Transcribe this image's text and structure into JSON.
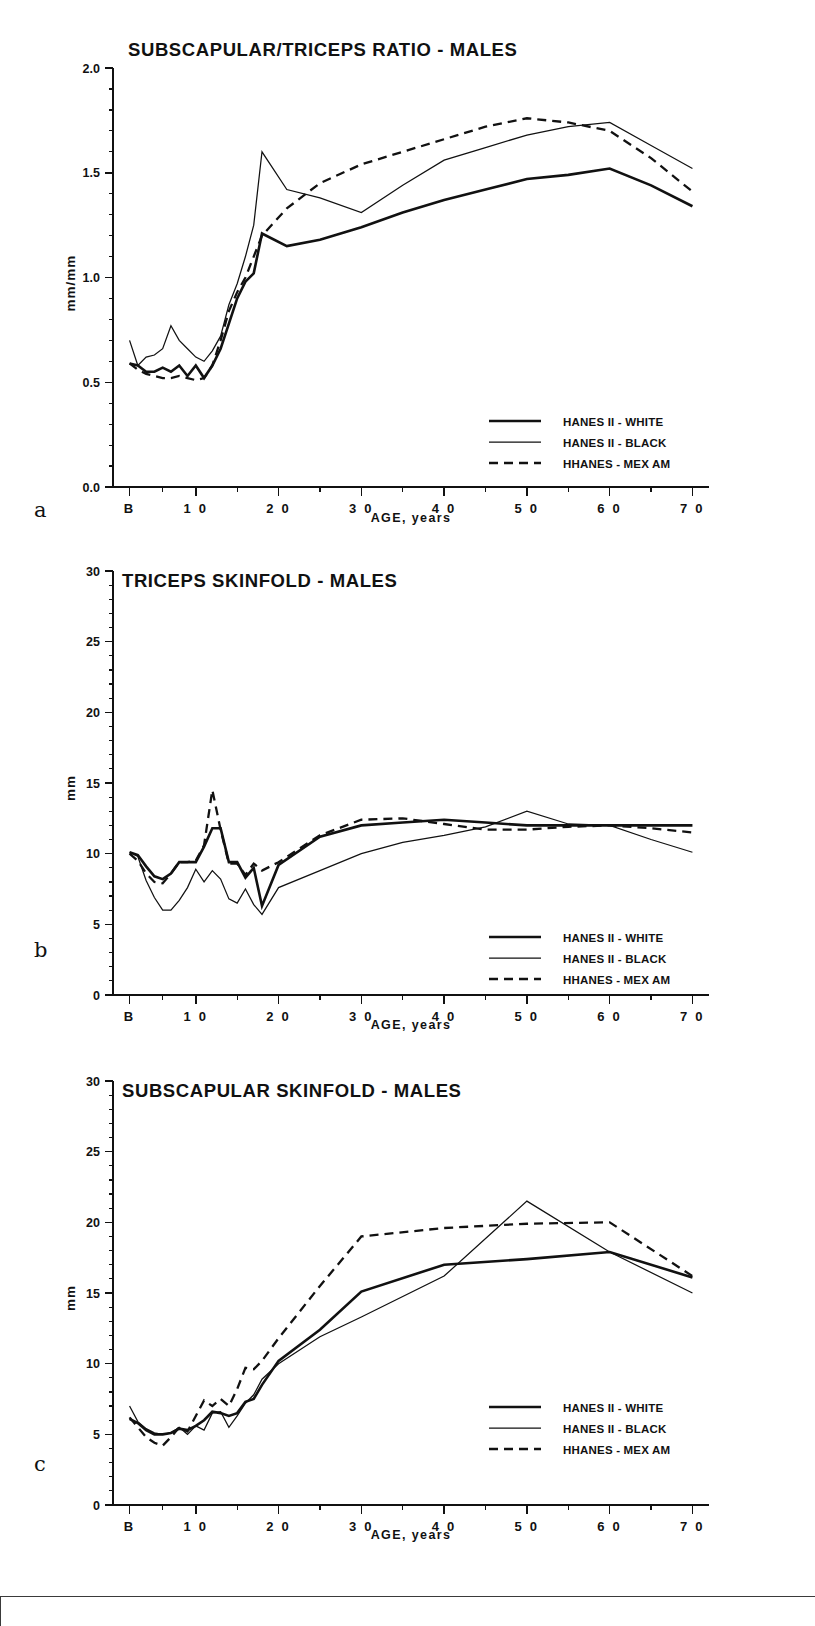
{
  "figure": {
    "panel_letters": [
      "a",
      "b",
      "c"
    ],
    "legend_entries": [
      {
        "label": "HANES II - WHITE",
        "style": "solid-thick"
      },
      {
        "label": "HANES II - BLACK",
        "style": "solid-thin"
      },
      {
        "label": "HHANES - MEX AM",
        "style": "dashed"
      }
    ]
  },
  "chart_data": [
    {
      "type": "line",
      "panel": "a",
      "title": "SUBSCAPULAR/TRICEPS RATIO - MALES",
      "xlabel": "AGE,  years",
      "ylabel": "mm/mm",
      "xlim": [
        0,
        72
      ],
      "ylim": [
        0.0,
        2.0
      ],
      "yticks": [
        0.0,
        0.5,
        1.0,
        1.5,
        2.0
      ],
      "yticklabels": [
        "0.0",
        "0.5",
        "1.0",
        "1.5",
        "2.0"
      ],
      "yminor_step": 0.1,
      "xticks": [
        2,
        10,
        20,
        30,
        40,
        50,
        60,
        70
      ],
      "xticklabels": [
        "B",
        "1 0",
        "2 0",
        "3 0",
        "4 0",
        "5 0",
        "6 0",
        "7 0"
      ],
      "xminor": [
        6,
        15,
        25,
        35,
        45,
        55,
        65
      ],
      "grid": false,
      "legend_position": "lower-right",
      "series": [
        {
          "name": "HANES II - WHITE",
          "x": [
            2,
            3,
            4,
            5,
            6,
            7,
            8,
            9,
            10,
            11,
            12,
            13,
            14,
            15,
            16,
            17,
            18,
            21,
            25,
            30,
            35,
            40,
            45,
            50,
            55,
            60,
            65,
            70
          ],
          "values": [
            0.59,
            0.58,
            0.55,
            0.55,
            0.57,
            0.55,
            0.58,
            0.53,
            0.58,
            0.52,
            0.58,
            0.66,
            0.78,
            0.9,
            0.98,
            1.02,
            1.21,
            1.15,
            1.18,
            1.24,
            1.31,
            1.37,
            1.42,
            1.47,
            1.49,
            1.52,
            1.44,
            1.34
          ]
        },
        {
          "name": "HANES II - BLACK",
          "x": [
            2,
            3,
            4,
            5,
            6,
            7,
            8,
            9,
            10,
            11,
            12,
            13,
            14,
            15,
            16,
            17,
            18,
            21,
            25,
            30,
            35,
            40,
            45,
            50,
            55,
            60,
            65,
            70
          ],
          "values": [
            0.7,
            0.58,
            0.62,
            0.63,
            0.66,
            0.77,
            0.7,
            0.66,
            0.62,
            0.6,
            0.65,
            0.72,
            0.87,
            0.97,
            1.1,
            1.25,
            1.6,
            1.42,
            1.38,
            1.31,
            1.44,
            1.56,
            1.62,
            1.68,
            1.72,
            1.74,
            1.63,
            1.52
          ]
        },
        {
          "name": "HHANES - MEX AM",
          "x": [
            2,
            3,
            4,
            5,
            6,
            7,
            8,
            9,
            10,
            11,
            12,
            13,
            14,
            15,
            16,
            17,
            18,
            21,
            25,
            30,
            35,
            40,
            45,
            50,
            55,
            60,
            65,
            70
          ],
          "values": [
            0.59,
            0.56,
            0.54,
            0.53,
            0.52,
            0.52,
            0.53,
            0.52,
            0.51,
            0.52,
            0.58,
            0.7,
            0.84,
            0.93,
            1.0,
            1.1,
            1.2,
            1.33,
            1.45,
            1.54,
            1.6,
            1.66,
            1.72,
            1.76,
            1.74,
            1.7,
            1.57,
            1.41
          ]
        }
      ]
    },
    {
      "type": "line",
      "panel": "b",
      "title": "TRICEPS SKINFOLD - MALES",
      "xlabel": "AGE,  years",
      "ylabel": "mm",
      "xlim": [
        0,
        72
      ],
      "ylim": [
        0,
        30
      ],
      "yticks": [
        0,
        5,
        10,
        15,
        20,
        25,
        30
      ],
      "yticklabels": [
        "0",
        "5",
        "10",
        "15",
        "20",
        "25",
        "30"
      ],
      "yminor_step": 1,
      "xticks": [
        2,
        10,
        20,
        30,
        40,
        50,
        60,
        70
      ],
      "xticklabels": [
        "B",
        "1 0",
        "2 0",
        "3 0",
        "4 0",
        "5 0",
        "6 0",
        "7 0"
      ],
      "xminor": [
        6,
        15,
        25,
        35,
        45,
        55,
        65
      ],
      "grid": false,
      "legend_position": "lower-right",
      "series": [
        {
          "name": "HANES II - WHITE",
          "x": [
            2,
            3,
            4,
            5,
            6,
            7,
            8,
            9,
            10,
            11,
            12,
            13,
            14,
            15,
            16,
            17,
            18,
            20,
            25,
            30,
            35,
            40,
            45,
            50,
            55,
            60,
            65,
            70
          ],
          "values": [
            10.1,
            9.9,
            9.1,
            8.4,
            8.2,
            8.6,
            9.4,
            9.4,
            9.4,
            10.5,
            11.8,
            11.8,
            9.4,
            9.4,
            8.3,
            9.0,
            6.3,
            9.2,
            11.2,
            12.0,
            12.2,
            12.4,
            12.2,
            12.0,
            12.0,
            12.0,
            12.0,
            12.0
          ]
        },
        {
          "name": "HANES II - BLACK",
          "x": [
            2,
            3,
            4,
            5,
            6,
            7,
            8,
            9,
            10,
            11,
            12,
            13,
            14,
            15,
            16,
            17,
            18,
            20,
            25,
            30,
            35,
            40,
            45,
            50,
            55,
            60,
            65,
            70
          ],
          "values": [
            10.1,
            9.8,
            8.1,
            6.9,
            6.0,
            6.0,
            6.7,
            7.6,
            8.9,
            8.0,
            8.8,
            8.2,
            6.8,
            6.5,
            7.5,
            6.4,
            5.7,
            7.6,
            8.8,
            10.0,
            10.8,
            11.3,
            11.9,
            13.0,
            12.1,
            12.0,
            11.0,
            10.1
          ]
        },
        {
          "name": "HHANES - MEX AM",
          "x": [
            2,
            3,
            4,
            5,
            6,
            7,
            8,
            9,
            10,
            11,
            12,
            13,
            14,
            15,
            16,
            17,
            18,
            20,
            25,
            30,
            35,
            40,
            45,
            50,
            55,
            60,
            65,
            70
          ],
          "values": [
            10.0,
            9.5,
            8.6,
            8.0,
            7.9,
            8.6,
            9.4,
            9.4,
            9.5,
            10.6,
            14.5,
            11.7,
            9.3,
            9.3,
            8.5,
            9.3,
            8.8,
            9.4,
            11.3,
            12.4,
            12.5,
            12.1,
            11.7,
            11.7,
            11.9,
            12.0,
            11.8,
            11.5
          ]
        }
      ]
    },
    {
      "type": "line",
      "panel": "c",
      "title": "SUBSCAPULAR SKINFOLD - MALES",
      "xlabel": "AGE,  years",
      "ylabel": "mm",
      "xlim": [
        0,
        72
      ],
      "ylim": [
        0,
        30
      ],
      "yticks": [
        0,
        5,
        10,
        15,
        20,
        25,
        30
      ],
      "yticklabels": [
        "0",
        "5",
        "10",
        "15",
        "20",
        "25",
        "30"
      ],
      "yminor_step": 1,
      "xticks": [
        2,
        10,
        20,
        30,
        40,
        50,
        60,
        70
      ],
      "xticklabels": [
        "B",
        "1 0",
        "2 0",
        "3 0",
        "4 0",
        "5 0",
        "6 0",
        "7 0"
      ],
      "xminor": [
        6,
        15,
        25,
        35,
        45,
        55,
        65
      ],
      "grid": false,
      "legend_position": "lower-right",
      "series": [
        {
          "name": "HANES II - WHITE",
          "x": [
            2,
            3,
            4,
            5,
            6,
            7,
            8,
            9,
            10,
            11,
            12,
            13,
            14,
            15,
            16,
            17,
            18,
            20,
            25,
            30,
            40,
            50,
            60,
            70
          ],
          "values": [
            6.1,
            5.8,
            5.3,
            5.0,
            5.0,
            5.1,
            5.4,
            5.3,
            5.6,
            6.0,
            6.6,
            6.5,
            6.3,
            6.5,
            7.3,
            7.5,
            8.5,
            10.2,
            12.4,
            15.1,
            17.0,
            17.4,
            17.9,
            16.1
          ]
        },
        {
          "name": "HANES II - BLACK",
          "x": [
            2,
            3,
            4,
            5,
            6,
            7,
            8,
            9,
            10,
            11,
            12,
            13,
            14,
            15,
            16,
            17,
            18,
            20,
            25,
            30,
            40,
            50,
            60,
            70
          ],
          "values": [
            7.0,
            5.9,
            5.4,
            5.1,
            5.0,
            5.1,
            5.5,
            5.0,
            5.6,
            5.3,
            6.5,
            6.6,
            5.5,
            6.3,
            7.2,
            7.8,
            8.9,
            10.0,
            11.9,
            13.3,
            16.2,
            21.5,
            17.9,
            15.0
          ]
        },
        {
          "name": "HHANES - MEX AM",
          "x": [
            2,
            3,
            4,
            5,
            6,
            7,
            8,
            9,
            10,
            11,
            12,
            13,
            14,
            15,
            16,
            17,
            18,
            20,
            25,
            30,
            40,
            50,
            60,
            70
          ],
          "values": [
            6.2,
            5.5,
            4.8,
            4.4,
            4.2,
            4.8,
            5.5,
            5.2,
            6.3,
            7.4,
            7.0,
            7.5,
            7.0,
            8.2,
            9.7,
            9.6,
            10.2,
            11.8,
            15.5,
            19.0,
            19.6,
            19.9,
            20.0,
            16.2
          ]
        }
      ]
    }
  ]
}
